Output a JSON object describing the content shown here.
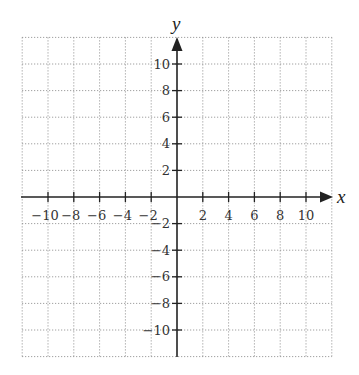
{
  "chart_data": {
    "type": "scatter",
    "title": "",
    "xlabel": "x",
    "ylabel": "y",
    "xlim": [
      -12,
      12
    ],
    "ylim": [
      -12,
      12
    ],
    "grid": true,
    "grid_step": 2,
    "grid_style": "dotted",
    "x_ticks": [
      -10,
      -8,
      -6,
      -4,
      -2,
      2,
      4,
      6,
      8,
      10
    ],
    "y_ticks": [
      10,
      8,
      6,
      4,
      2,
      -2,
      -4,
      -6,
      -8,
      -10
    ],
    "x_tick_labels": [
      "−10",
      "−8",
      "−6",
      "−4",
      "−2",
      "2",
      "4",
      "6",
      "8",
      "10"
    ],
    "y_tick_labels": [
      "10",
      "8",
      "6",
      "4",
      "2",
      "−2",
      "−4",
      "−6",
      "−8",
      "−10"
    ],
    "series": [],
    "legend": null
  },
  "colors": {
    "axis": "#222222",
    "grid": "#8a8a8a",
    "background": "#ffffff"
  }
}
